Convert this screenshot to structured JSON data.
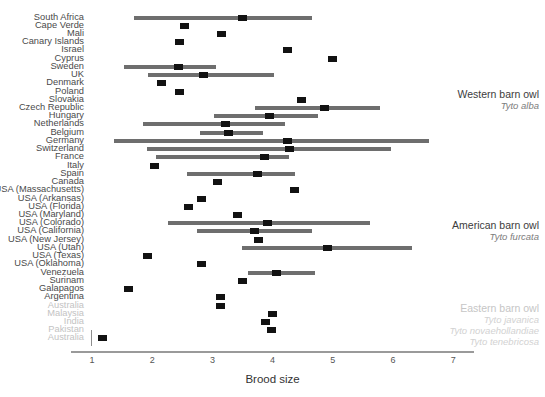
{
  "chart_data": {
    "type": "bar",
    "subtype": "forest-plot",
    "title": "",
    "xlabel": "Brood size",
    "ylabel": "",
    "xlim": [
      0.65,
      7.35
    ],
    "xticks": [
      1,
      2,
      3,
      4,
      5,
      6,
      7
    ],
    "xtick_labels": [
      "1",
      "2",
      "3",
      "4",
      "5",
      "6",
      "7"
    ],
    "grid": false,
    "legend": "none",
    "orientation": "horizontal",
    "marker": "black square = mean brood size; grey bar = range",
    "categories": [
      "South Africa",
      "Cape Verde",
      "Mali",
      "Canary Islands",
      "Israel",
      "Cyprus",
      "Sweden",
      "UK",
      "Denmark",
      "Poland",
      "Slovakia",
      "Czech Republic",
      "Hungary",
      "Netherlands",
      "Belgium",
      "Germany",
      "Switzerland",
      "France",
      "Italy",
      "Spain",
      "Canada",
      "USA (Massachusetts)",
      "USA (Arkansas)",
      "USA (Florida)",
      "USA (Maryland)",
      "USA (Colorado)",
      "USA (California)",
      "USA (New Jersey)",
      "USA (Utah)",
      "USA (Texas)",
      "USA (Oklahoma)",
      "Venezuela",
      "Surinam",
      "Galapagos",
      "Argentina",
      "Australia",
      "Malaysia",
      "India",
      "Pakistan",
      "Australia"
    ],
    "rows": [
      {
        "label": "South Africa",
        "mean": 3.5,
        "low": 1.7,
        "high": 4.65,
        "faded": false
      },
      {
        "label": "Cape Verde",
        "mean": 2.53,
        "low": null,
        "high": null,
        "faded": false
      },
      {
        "label": "Mali",
        "mean": 3.15,
        "low": null,
        "high": null,
        "faded": false
      },
      {
        "label": "Canary Islands",
        "mean": 2.46,
        "low": null,
        "high": null,
        "faded": false
      },
      {
        "label": "Israel",
        "mean": 4.24,
        "low": null,
        "high": null,
        "faded": false
      },
      {
        "label": "Cyprus",
        "mean": 5.0,
        "low": null,
        "high": null,
        "faded": false
      },
      {
        "label": "Sweden",
        "mean": 2.43,
        "low": 1.53,
        "high": 3.06,
        "faded": false
      },
      {
        "label": "UK",
        "mean": 2.86,
        "low": 1.93,
        "high": 4.03,
        "faded": false
      },
      {
        "label": "Denmark",
        "mean": 2.16,
        "low": null,
        "high": null,
        "faded": false
      },
      {
        "label": "Poland",
        "mean": 2.46,
        "low": null,
        "high": null,
        "faded": false
      },
      {
        "label": "Slovakia",
        "mean": 4.48,
        "low": null,
        "high": null,
        "faded": false
      },
      {
        "label": "Czech Republic",
        "mean": 4.86,
        "low": 3.7,
        "high": 5.78,
        "faded": false
      },
      {
        "label": "Hungary",
        "mean": 3.95,
        "low": 3.02,
        "high": 4.75,
        "faded": false
      },
      {
        "label": "Netherlands",
        "mean": 3.22,
        "low": 1.85,
        "high": 4.2,
        "faded": false
      },
      {
        "label": "Belgium",
        "mean": 3.26,
        "low": 2.79,
        "high": 3.84,
        "faded": false
      },
      {
        "label": "Germany",
        "mean": 4.25,
        "low": 1.36,
        "high": 6.6,
        "faded": false
      },
      {
        "label": "Switzerland",
        "mean": 4.28,
        "low": 1.91,
        "high": 5.97,
        "faded": false
      },
      {
        "label": "France",
        "mean": 3.87,
        "low": 2.06,
        "high": 4.28,
        "faded": false
      },
      {
        "label": "Italy",
        "mean": 2.04,
        "low": null,
        "high": null,
        "faded": false
      },
      {
        "label": "Spain",
        "mean": 3.75,
        "low": 2.58,
        "high": 4.37,
        "faded": false
      },
      {
        "label": "Canada",
        "mean": 3.09,
        "low": null,
        "high": null,
        "faded": false
      },
      {
        "label": "USA (Massachusetts)",
        "mean": 4.37,
        "low": null,
        "high": null,
        "faded": false
      },
      {
        "label": "USA (Arkansas)",
        "mean": 2.82,
        "low": null,
        "high": null,
        "faded": false
      },
      {
        "label": "USA (Florida)",
        "mean": 2.61,
        "low": null,
        "high": null,
        "faded": false
      },
      {
        "label": "USA (Maryland)",
        "mean": 3.42,
        "low": null,
        "high": null,
        "faded": false
      },
      {
        "label": "USA (Colorado)",
        "mean": 3.92,
        "low": 2.26,
        "high": 5.61,
        "faded": false
      },
      {
        "label": "USA (California)",
        "mean": 3.7,
        "low": 2.74,
        "high": 4.65,
        "faded": false
      },
      {
        "label": "USA (New Jersey)",
        "mean": 3.77,
        "low": null,
        "high": null,
        "faded": false
      },
      {
        "label": "USA (Utah)",
        "mean": 4.91,
        "low": 3.49,
        "high": 6.31,
        "faded": false
      },
      {
        "label": "USA (Texas)",
        "mean": 1.93,
        "low": null,
        "high": null,
        "faded": false
      },
      {
        "label": "USA (Oklahoma)",
        "mean": 2.82,
        "low": null,
        "high": null,
        "faded": false
      },
      {
        "label": "Venezuela",
        "mean": 4.07,
        "low": 3.59,
        "high": 4.7,
        "faded": false
      },
      {
        "label": "Surinam",
        "mean": 3.5,
        "low": null,
        "high": null,
        "faded": false
      },
      {
        "label": "Galapagos",
        "mean": 1.6,
        "low": null,
        "high": null,
        "faded": false
      },
      {
        "label": "Argentina",
        "mean": 3.14,
        "low": null,
        "high": null,
        "faded": false
      },
      {
        "label": "Australia",
        "mean": 3.14,
        "low": null,
        "high": null,
        "faded": true
      },
      {
        "label": "Malaysia",
        "mean": 4.0,
        "low": null,
        "high": null,
        "faded": true
      },
      {
        "label": "India",
        "mean": 3.88,
        "low": null,
        "high": null,
        "faded": true
      },
      {
        "label": "Pakistan",
        "mean": 3.98,
        "low": null,
        "high": null,
        "faded": true
      },
      {
        "label": "Australia",
        "mean": 1.17,
        "low": null,
        "high": null,
        "faded": true,
        "whisker_at": 0.99
      }
    ],
    "annotations": [
      {
        "common": "Western barn owl",
        "sci": [
          "Tyto alba"
        ],
        "faded": false,
        "row_anchor": 10
      },
      {
        "common": "American barn owl",
        "sci": [
          "Tyto furcata"
        ],
        "faded": false,
        "row_anchor": 26
      },
      {
        "common": "Eastern barn owl",
        "sci": [
          "Tyto javanica",
          "Tyto novaehollandiae",
          "Tyto tenebricosa"
        ],
        "faded": true,
        "row_anchor": 36
      }
    ]
  },
  "colors": {
    "bar": "#6e6e6e",
    "point": "#121212",
    "axis": "#9a9a9a",
    "label": "#4a4a4a",
    "label_faded": "#c3c3c3",
    "background": "#ffffff"
  }
}
